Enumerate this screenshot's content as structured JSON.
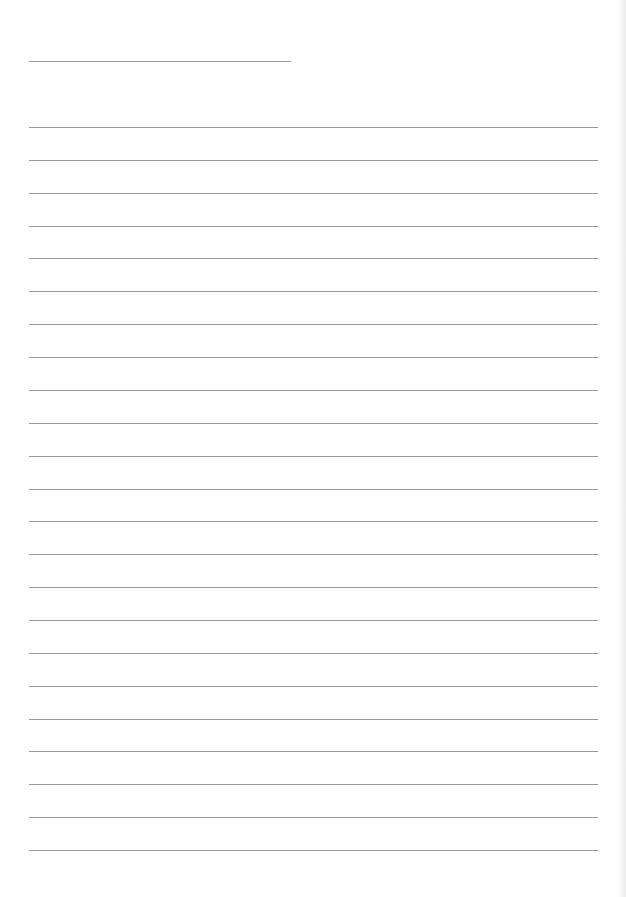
{
  "document": {
    "type": "lined-paper",
    "title_line": {
      "y": 61,
      "x_start": 29,
      "x_end": 291
    },
    "ruled_lines": {
      "count": 23,
      "first_y": 127,
      "last_y": 850,
      "x_start": 29,
      "x_end": 598
    },
    "colors": {
      "paper": "#fefefe",
      "line": "#9a9a9a"
    }
  }
}
